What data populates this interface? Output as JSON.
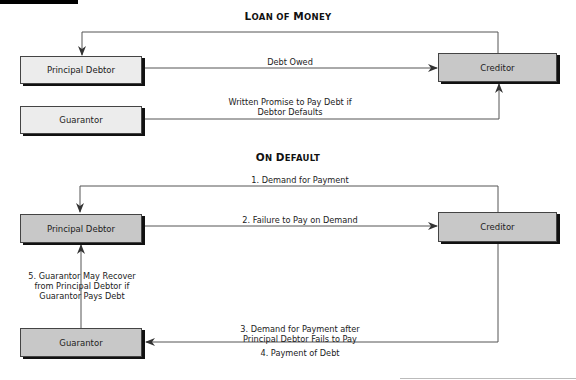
{
  "header": {
    "tab_bar": ""
  },
  "sections": [
    {
      "title_first": "L",
      "title_rest": "OAN OF ",
      "title_first2": "M",
      "title_rest2": "ONEY",
      "title": "Loan of Money",
      "nodes": {
        "principal_debtor": "Principal Debtor",
        "creditor": "Creditor",
        "guarantor": "Guarantor"
      },
      "edges": [
        {
          "from": "creditor",
          "to": "principal_debtor",
          "label": ""
        },
        {
          "from": "principal_debtor",
          "to": "creditor",
          "label": "Debt Owed"
        },
        {
          "from": "guarantor",
          "to": "creditor",
          "label_line1": "Written Promise to Pay Debt if",
          "label_line2": "Debtor Defaults"
        }
      ]
    },
    {
      "title_first": "O",
      "title_rest": "N ",
      "title_first2": "D",
      "title_rest2": "EFAULT",
      "title": "On Default",
      "nodes": {
        "principal_debtor": "Principal Debtor",
        "creditor": "Creditor",
        "guarantor": "Guarantor"
      },
      "edges": [
        {
          "from": "creditor",
          "to": "principal_debtor",
          "label": "1. Demand for Payment"
        },
        {
          "from": "principal_debtor",
          "to": "creditor",
          "label": "2. Failure to Pay on Demand"
        },
        {
          "from": "creditor",
          "to": "guarantor",
          "label_line1": "3. Demand for Payment after",
          "label_line2": "Principal Debtor Fails to Pay"
        },
        {
          "from": "guarantor",
          "to": "creditor",
          "label": "4. Payment of Debt"
        },
        {
          "from": "guarantor",
          "to": "principal_debtor",
          "label_line1": "5. Guarantor May Recover",
          "label_line2": "from Principal Debtor if",
          "label_line3": "Guarantor Pays Debt"
        }
      ]
    }
  ],
  "colors": {
    "light_box": "#ececec",
    "mid_box": "#c8c8c8",
    "line": "#555555",
    "shadow": "#111111"
  }
}
